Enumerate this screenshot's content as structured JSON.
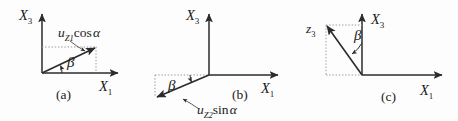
{
  "figure": {
    "type": "technical-vector-diagram",
    "background_color": "#fdfdfd",
    "line_color": "#2b2b2b",
    "dotted_color": "#9a9a9a",
    "panels": [
      {
        "id": "a",
        "caption": "(a)",
        "vertical_axis_label_main": "X",
        "vertical_axis_label_sub": "3",
        "horizontal_axis_label_main": "X",
        "horizontal_axis_label_sub": "1",
        "angle_label": "β",
        "vector_label_main": "u",
        "vector_label_sub": "Z1",
        "vector_label_fn": "cos",
        "vector_label_arg": "α",
        "vector_label_full": "u_{Z1} cos α",
        "vector_direction": "up-right",
        "description": "Vector from origin pointing up and to the right, angle beta measured from the X1 axis"
      },
      {
        "id": "b",
        "caption": "(b)",
        "vertical_axis_label_main": "X",
        "vertical_axis_label_sub": "3",
        "horizontal_axis_label_main": "X",
        "horizontal_axis_label_sub": "1",
        "angle_label": "β",
        "vector_label_main": "u",
        "vector_label_sub": "Z2",
        "vector_label_fn": "sin",
        "vector_label_arg": "α",
        "vector_label_full": "u_{Z2} sin α",
        "vector_direction": "down-left",
        "description": "Vector from origin pointing down and to the left, angle beta measured from the horizontal dotted line"
      },
      {
        "id": "c",
        "caption": "(c)",
        "vertical_axis_label_main": "X",
        "vertical_axis_label_sub": "3",
        "horizontal_axis_label_main": "X",
        "horizontal_axis_label_sub": "1",
        "angle_label": "β",
        "vector_label_main": "z",
        "vector_label_sub": "3",
        "vector_label_full": "z_3",
        "vector_direction": "up-left",
        "description": "Vector from origin pointing up and to the left, angle beta measured from the X3 axis"
      }
    ]
  }
}
